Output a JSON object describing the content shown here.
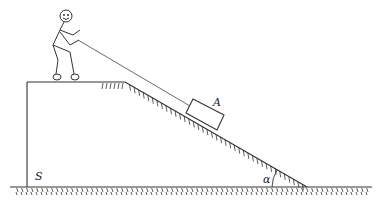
{
  "diagram": {
    "labels": {
      "block": "A",
      "support": "S",
      "angle": "α"
    },
    "colors": {
      "stroke": "#333333",
      "background": "#ffffff"
    },
    "elements": [
      "stick-figure-person",
      "rope",
      "block-A",
      "inclined-plane",
      "hatched-ground",
      "vertical-wall-S",
      "angle-alpha-arc"
    ]
  }
}
